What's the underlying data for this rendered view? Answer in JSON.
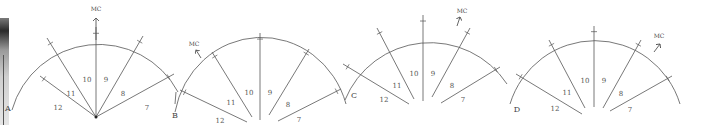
{
  "figure": {
    "colors": {
      "stroke": "#555555",
      "text": "#555555",
      "background": "#ffffff"
    },
    "diagrams": [
      {
        "id": "A",
        "letter": "A",
        "mc_label": "MC",
        "center": [
          96,
          117
        ],
        "arc": {
          "start": [
            12,
            110
          ],
          "end": [
            178,
            92
          ],
          "rx": 90,
          "ry": 90
        },
        "spokes": [
          [
            40,
            76
          ],
          [
            47,
            38
          ],
          [
            96,
            27
          ],
          [
            143,
            36
          ],
          [
            174,
            74
          ]
        ],
        "spoke_ticks": true,
        "extra_tail": [
          [
            176,
            92
          ],
          [
            175,
            104
          ]
        ],
        "mc_arrow": {
          "from": [
            96,
            40
          ],
          "to": [
            96,
            18
          ]
        },
        "mc_text": [
          96,
          11
        ],
        "letter_pos": [
          8,
          111
        ],
        "houses": [
          {
            "label": "12",
            "x": 58,
            "y": 110
          },
          {
            "label": "11",
            "x": 71,
            "y": 96
          },
          {
            "label": "10",
            "x": 87,
            "y": 82
          },
          {
            "label": "9",
            "x": 106,
            "y": 82
          },
          {
            "label": "8",
            "x": 123,
            "y": 96
          },
          {
            "label": "7",
            "x": 147,
            "y": 110
          }
        ]
      },
      {
        "id": "B",
        "letter": "B",
        "mc_label": "MC",
        "center": [
          260,
          125
        ],
        "arc": {
          "start": [
            175,
            112
          ],
          "end": [
            346,
            104
          ],
          "rx": 88,
          "ry": 92
        },
        "spokes": [
          [
            180,
            90
          ],
          [
            212,
            52
          ],
          [
            260,
            33
          ],
          [
            309,
            49
          ],
          [
            341,
            89
          ]
        ],
        "spoke_inner": [
          [
            247,
            122
          ],
          [
            252,
            117
          ],
          [
            260,
            120
          ],
          [
            269,
            115
          ],
          [
            278,
            121
          ]
        ],
        "mc_arrow": {
          "from": [
            201,
            58
          ],
          "to": [
            196,
            50
          ]
        },
        "mc_text": [
          194,
          46
        ],
        "letter_pos": [
          175,
          118
        ],
        "houses": [
          {
            "label": "12",
            "x": 220,
            "y": 123
          },
          {
            "label": "11",
            "x": 231,
            "y": 105
          },
          {
            "label": "10",
            "x": 249,
            "y": 95
          },
          {
            "label": "9",
            "x": 270,
            "y": 95
          },
          {
            "label": "8",
            "x": 288,
            "y": 107
          },
          {
            "label": "7",
            "x": 299,
            "y": 122
          }
        ]
      },
      {
        "id": "C",
        "letter": "C",
        "mc_label": "MC",
        "center": [
          423,
          112
        ],
        "arc": {
          "start": [
            345,
            100
          ],
          "end": [
            507,
            84
          ],
          "rx": 92,
          "ry": 92
        },
        "spokes": [
          [
            343,
            64
          ],
          [
            377,
            28
          ],
          [
            423,
            15
          ],
          [
            470,
            28
          ],
          [
            500,
            67
          ]
        ],
        "spoke_inner": [
          [
            409,
            104
          ],
          [
            414,
            99
          ],
          [
            423,
            101
          ],
          [
            432,
            97
          ],
          [
            441,
            103
          ]
        ],
        "mc_arrow": {
          "from": [
            457,
            26
          ],
          "to": [
            460,
            17
          ]
        },
        "mc_text": [
          462,
          13
        ],
        "letter_pos": [
          354,
          98
        ],
        "houses": [
          {
            "label": "12",
            "x": 384,
            "y": 102
          },
          {
            "label": "11",
            "x": 397,
            "y": 88
          },
          {
            "label": "10",
            "x": 414,
            "y": 76
          },
          {
            "label": "9",
            "x": 433,
            "y": 76
          },
          {
            "label": "8",
            "x": 452,
            "y": 88
          },
          {
            "label": "7",
            "x": 463,
            "y": 102
          }
        ]
      },
      {
        "id": "D",
        "letter": "D",
        "mc_label": "MC",
        "center": [
          594,
          120
        ],
        "arc": {
          "start": [
            510,
            104
          ],
          "end": [
            680,
            104
          ],
          "rx": 89,
          "ry": 90
        },
        "spokes": [
          [
            516,
            74
          ],
          [
            549,
            40
          ],
          [
            594,
            26
          ],
          [
            641,
            40
          ],
          [
            672,
            76
          ]
        ],
        "spoke_inner": [
          [
            582,
            114
          ],
          [
            585,
            108
          ],
          [
            594,
            107
          ],
          [
            603,
            108
          ],
          [
            610,
            111
          ]
        ],
        "mc_arrow": {
          "from": [
            654,
            52
          ],
          "to": [
            660,
            44
          ]
        },
        "mc_text": [
          659,
          38
        ],
        "letter_pos": [
          517,
          112
        ],
        "houses": [
          {
            "label": "12",
            "x": 555,
            "y": 111
          },
          {
            "label": "11",
            "x": 567,
            "y": 95
          },
          {
            "label": "10",
            "x": 585,
            "y": 83
          },
          {
            "label": "9",
            "x": 604,
            "y": 83
          },
          {
            "label": "8",
            "x": 621,
            "y": 96
          },
          {
            "label": "7",
            "x": 630,
            "y": 112
          }
        ]
      }
    ]
  }
}
